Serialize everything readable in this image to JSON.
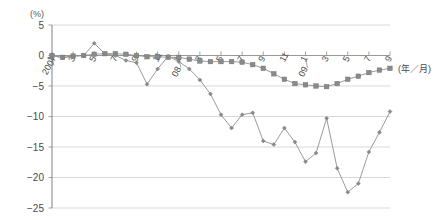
{
  "chart_data": {
    "type": "line",
    "title": "",
    "subtitle": "",
    "xlabel": "(年／月)",
    "ylabel": "(%)",
    "ylim": [
      -25,
      5
    ],
    "xlim": [
      0,
      32
    ],
    "grid": true,
    "legend": "none",
    "yticks": [
      5,
      0,
      -5,
      -10,
      -15,
      -20,
      -25
    ],
    "ytick_labels": [
      "5",
      "0",
      "−5",
      "−10",
      "−15",
      "−20",
      "−25"
    ],
    "x": [
      "2007/1",
      "2007/2",
      "2007/3",
      "2007/4",
      "2007/5",
      "2007/6",
      "2007/7",
      "2007/8",
      "2007/9",
      "2007/10",
      "2007/11",
      "2007/12",
      "2008/1",
      "2008/2",
      "2008/3",
      "2008/4",
      "2008/5",
      "2008/6",
      "2008/7",
      "2008/8",
      "2008/9",
      "2008/10",
      "2008/11",
      "2008/12",
      "2009/1",
      "2009/2",
      "2009/3",
      "2009/4",
      "2009/5",
      "2009/6",
      "2009/7",
      "2009/8",
      "2009/9"
    ],
    "xtick_labels": [
      "1",
      "3",
      "5",
      "7",
      "9",
      "11",
      "1",
      "3",
      "5",
      "7",
      "9",
      "11",
      "1",
      "3",
      "5",
      "7",
      "9"
    ],
    "xtick_indices": [
      0,
      2,
      4,
      6,
      8,
      10,
      12,
      14,
      16,
      18,
      20,
      22,
      24,
      26,
      28,
      30,
      32
    ],
    "year_markers": [
      {
        "label": "2007",
        "index": 0
      },
      {
        "label": "08",
        "index": 12
      },
      {
        "label": "09",
        "index": 24
      }
    ],
    "series": [
      {
        "name": "series-square",
        "marker": "square",
        "color": "#8a8a8a",
        "values": [
          0.0,
          -0.3,
          -0.1,
          0.0,
          0.2,
          0.3,
          0.3,
          0.2,
          0.0,
          -0.2,
          -0.2,
          -0.3,
          -0.3,
          -0.6,
          -0.9,
          -1.0,
          -1.0,
          -1.0,
          -1.1,
          -1.5,
          -2.1,
          -3.0,
          -3.9,
          -4.6,
          -4.8,
          -5.0,
          -5.1,
          -4.6,
          -3.9,
          -3.4,
          -2.8,
          -2.4,
          -2.1
        ]
      },
      {
        "name": "series-diamond",
        "marker": "diamond",
        "color": "#8a8a8a",
        "values": [
          0.0,
          -0.4,
          -0.1,
          0.0,
          2.0,
          0.3,
          0.0,
          -0.8,
          -1.2,
          -4.7,
          -2.2,
          -0.1,
          -1.0,
          -2.2,
          -4.0,
          -6.3,
          -9.7,
          -11.9,
          -9.7,
          -9.4,
          -14.0,
          -14.6,
          -11.9,
          -14.2,
          -17.4,
          -16.0,
          -10.3,
          -18.5,
          -22.4,
          -21.0,
          -15.8,
          -12.6,
          -9.2
        ]
      }
    ],
    "diamond_values_detail": [
      0.0,
      -0.4,
      -0.1,
      0.0,
      2.0,
      0.3,
      0.0,
      -0.8,
      -1.2,
      -4.7,
      -2.2,
      -0.1,
      -1.0,
      -2.2,
      -4.0,
      -6.3,
      -9.7,
      -11.9,
      -9.7,
      -9.4,
      -14.0,
      -14.6,
      -11.9,
      -14.2,
      -17.4,
      -16.0,
      -10.3,
      -18.5,
      -22.4,
      -21.0,
      -15.8,
      -12.6,
      -9.2
    ]
  }
}
